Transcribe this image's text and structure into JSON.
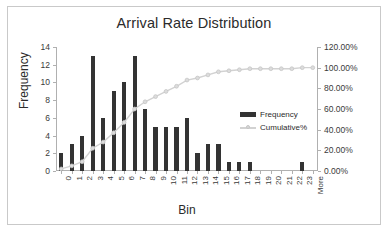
{
  "chart_data": {
    "type": "bar",
    "title": "Arrival Rate Distribution",
    "xlabel": "Bin",
    "ylabel": "Frequency",
    "y2label": "",
    "grid": false,
    "legend_position": "inside-right",
    "categories": [
      "0",
      "1",
      "2",
      "3",
      "4",
      "5",
      "6",
      "7",
      "8",
      "9",
      "10",
      "11",
      "12",
      "13",
      "14",
      "15",
      "16",
      "17",
      "18",
      "19",
      "20",
      "21",
      "22",
      "23",
      "More"
    ],
    "ylim": [
      0,
      14
    ],
    "yticks": [
      "0",
      "2",
      "4",
      "6",
      "8",
      "10",
      "12",
      "14"
    ],
    "y2lim": [
      0,
      1.2
    ],
    "y2ticks": [
      "0.00%",
      "20.00%",
      "40.00%",
      "60.00%",
      "80.00%",
      "100.00%",
      "120.00%"
    ],
    "series": [
      {
        "name": "Frequency",
        "type": "bar",
        "color": "#333333",
        "axis": "left",
        "values": [
          2,
          3,
          4,
          13,
          6,
          9,
          10,
          13,
          7,
          5,
          5,
          5,
          6,
          2,
          3,
          3,
          1,
          1,
          1,
          0,
          0,
          0,
          0,
          1,
          0
        ]
      },
      {
        "name": "Cumulative%",
        "type": "line",
        "color": "#d2d2d2",
        "axis": "right",
        "values": [
          0.02,
          0.05,
          0.09,
          0.22,
          0.28,
          0.37,
          0.47,
          0.6,
          0.67,
          0.72,
          0.77,
          0.82,
          0.88,
          0.9,
          0.93,
          0.96,
          0.97,
          0.98,
          0.99,
          0.99,
          0.99,
          0.99,
          0.99,
          1.0,
          1.0
        ]
      }
    ]
  },
  "legend": {
    "frequency_label": "Frequency",
    "cumulative_label": "Cumulative%"
  }
}
